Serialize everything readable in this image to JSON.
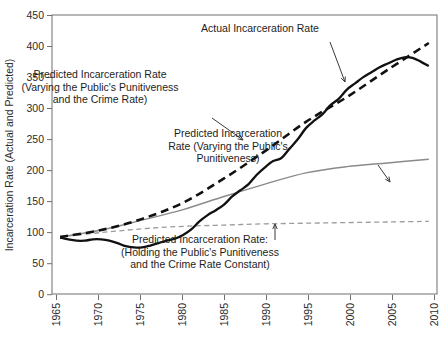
{
  "chart_data": {
    "type": "line",
    "title": "",
    "xlabel": "",
    "ylabel": "Incarceration Rate (Actual and Predicted)",
    "xlim": [
      1964,
      2011
    ],
    "ylim": [
      0,
      450
    ],
    "xticks": [
      1965,
      1970,
      1975,
      1980,
      1985,
      1990,
      1995,
      2000,
      2005,
      2010
    ],
    "yticks": [
      0,
      50,
      100,
      150,
      200,
      250,
      300,
      350,
      400,
      450
    ],
    "xtick_labels": [
      "1965",
      "1970",
      "1975",
      "1980",
      "1985",
      "1990",
      "1995",
      "2000",
      "2005",
      "2010"
    ],
    "ytick_labels": [
      "0",
      "50",
      "100",
      "150",
      "200",
      "250",
      "300",
      "350",
      "400",
      "450"
    ],
    "grid": false,
    "legend_position": "inline-annotations",
    "series": [
      {
        "name": "Actual Incarceration Rate",
        "style": "solid-thick-black",
        "color": "#111111",
        "x": [
          1965,
          1966,
          1967,
          1968,
          1969,
          1970,
          1971,
          1972,
          1973,
          1974,
          1975,
          1976,
          1977,
          1978,
          1979,
          1980,
          1981,
          1982,
          1983,
          1984,
          1985,
          1986,
          1987,
          1988,
          1989,
          1990,
          1991,
          1992,
          1993,
          1994,
          1995,
          1996,
          1997,
          1998,
          1999,
          2000,
          2001,
          2002,
          2003,
          2004,
          2005,
          2006,
          2007,
          2008,
          2009,
          2010
        ],
        "values": [
          92,
          89,
          87,
          87,
          89,
          89,
          87,
          83,
          78,
          76,
          76,
          79,
          83,
          87,
          90,
          96,
          105,
          118,
          128,
          136,
          145,
          158,
          168,
          178,
          193,
          205,
          215,
          220,
          235,
          250,
          268,
          280,
          290,
          305,
          315,
          330,
          340,
          350,
          358,
          366,
          372,
          378,
          382,
          381,
          375,
          368
        ],
        "note": "Rises steeply after 1980; flattens around 2007-2010"
      },
      {
        "name": "Predicted Incarceration Rate (Varying the Public's Punitiveness and the Crime Rate)",
        "style": "dashed-thick-black",
        "color": "#111111",
        "x": [
          1965,
          1970,
          1975,
          1980,
          1985,
          1990,
          1995,
          2000,
          2005,
          2010
        ],
        "values": [
          93,
          104,
          122,
          148,
          187,
          231,
          278,
          318,
          362,
          405
        ]
      },
      {
        "name": "Predicted Incarceration Rate (Varying the Public's Punitiveness)",
        "style": "solid-thin-gray",
        "color": "#8a8a8a",
        "x": [
          1965,
          1970,
          1975,
          1980,
          1985,
          1990,
          1995,
          2000,
          2005,
          2010
        ],
        "values": [
          93,
          104,
          120,
          137,
          158,
          178,
          196,
          206,
          212,
          218
        ]
      },
      {
        "name": "Predicted Incarceration Rate: (Holding the Public's Punitiveness and the Crime Rate Constant)",
        "style": "dashed-thin-gray",
        "color": "#9b9b9b",
        "x": [
          1965,
          1970,
          1975,
          1980,
          1985,
          1990,
          1995,
          2000,
          2005,
          2010
        ],
        "values": [
          93,
          100,
          106,
          110,
          112,
          114,
          115,
          116,
          117,
          118
        ]
      }
    ],
    "annotations": [
      {
        "id": "actual",
        "lines": [
          "Actual Incarceration Rate"
        ],
        "text_x": 260,
        "text_y": 32,
        "arrow_from": [
          330,
          42
        ],
        "arrow_to": [
          345,
          82
        ]
      },
      {
        "id": "vary-both",
        "lines": [
          "Predicted Incarceration Rate",
          "(Varying the Public's Punitiveness",
          "and the Crime Rate)"
        ],
        "text_x": 100,
        "text_y": 78,
        "arrow_from": [
          212,
          118
        ],
        "arrow_to": [
          243,
          140
        ]
      },
      {
        "id": "vary-punitiveness",
        "lines": [
          "Predicted Incarceration",
          "Rate (Varying the Public's",
          "Punitiveness)"
        ],
        "text_x": 228,
        "text_y": 137,
        "arrow_from": [
          378,
          165
        ],
        "arrow_to": [
          390,
          182
        ]
      },
      {
        "id": "holding-constant",
        "lines": [
          "Predicted Incarceration Rate:",
          "(Holding the Public's Punitiveness",
          "and the Crime Rate Constant)"
        ],
        "text_x": 200,
        "text_y": 243,
        "arrow_from": [
          275,
          240
        ],
        "arrow_to": [
          275,
          224
        ]
      }
    ]
  },
  "axes": {
    "y_title": "Incarceration Rate (Actual and Predicted)"
  }
}
